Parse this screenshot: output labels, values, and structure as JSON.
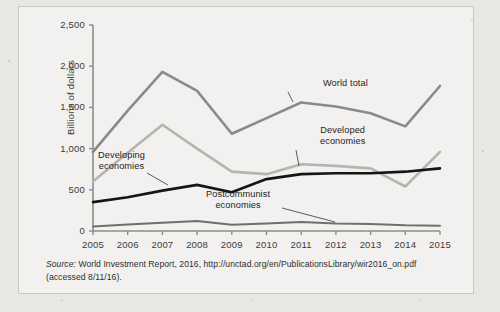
{
  "figure": {
    "ylabel": "Billions of dollars",
    "source_prefix": "Source:",
    "source_text": " World Investment Report, 2016, http://unctad.org/en/PublicationsLibrary/wir2016_on.pdf",
    "source_access": "(accessed 8/11/16)."
  },
  "chart_data": {
    "type": "line",
    "title": "",
    "xlabel": "",
    "ylabel": "Billions of dollars",
    "x": [
      2005,
      2006,
      2007,
      2008,
      2009,
      2010,
      2011,
      2012,
      2013,
      2014,
      2015
    ],
    "xtick_labels": [
      "2005",
      "2006",
      "2007",
      "2008",
      "2009",
      "2010",
      "2011",
      "2012",
      "2013",
      "2014",
      "2015"
    ],
    "ytick_labels": [
      "0",
      "500",
      "1,000",
      "1,500",
      "2,000",
      "2,500"
    ],
    "yticks": [
      0,
      500,
      1000,
      1500,
      2000,
      2500
    ],
    "ylim": [
      0,
      2500
    ],
    "grid": false,
    "legend": "annotations",
    "series": [
      {
        "name": "World total",
        "color": "#8a8a88",
        "width": 2.6,
        "values": [
          960,
          1460,
          1930,
          1700,
          1180,
          1370,
          1560,
          1510,
          1430,
          1270,
          1760
        ]
      },
      {
        "name": "Developed economies",
        "color": "#b5b4b1",
        "width": 2.6,
        "values": [
          600,
          950,
          1290,
          1000,
          720,
          690,
          810,
          790,
          760,
          540,
          960
        ]
      },
      {
        "name": "Developing economies",
        "color": "#151515",
        "width": 2.6,
        "values": [
          350,
          410,
          490,
          560,
          470,
          630,
          690,
          700,
          700,
          720,
          760
        ]
      },
      {
        "name": "Postcommunist economies",
        "color": "#6f6f6d",
        "width": 2.0,
        "values": [
          55,
          80,
          100,
          120,
          75,
          90,
          110,
          90,
          85,
          70,
          65
        ]
      }
    ],
    "annotations": [
      {
        "name": "World total",
        "label_lines": [
          "World total"
        ]
      },
      {
        "name": "Developed economies",
        "label_lines": [
          "Developed",
          "economies"
        ]
      },
      {
        "name": "Developing economies",
        "label_lines": [
          "Developing",
          "economies"
        ]
      },
      {
        "name": "Postcommunist economies",
        "label_lines": [
          "Postcommunist",
          "economies"
        ]
      }
    ]
  }
}
